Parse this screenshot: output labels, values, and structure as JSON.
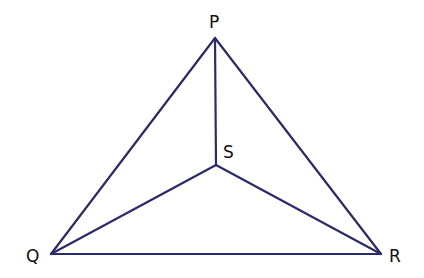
{
  "diagram": {
    "line_color": "#2b2a6b",
    "points": {
      "P": {
        "label": "P",
        "x": 215,
        "y": 38
      },
      "Q": {
        "label": "Q",
        "x": 51,
        "y": 254
      },
      "R": {
        "label": "R",
        "x": 381,
        "y": 254
      },
      "S": {
        "label": "S",
        "x": 216,
        "y": 165
      }
    },
    "segments": [
      [
        "P",
        "Q"
      ],
      [
        "Q",
        "R"
      ],
      [
        "R",
        "P"
      ],
      [
        "P",
        "S"
      ],
      [
        "Q",
        "S"
      ],
      [
        "R",
        "S"
      ]
    ]
  }
}
